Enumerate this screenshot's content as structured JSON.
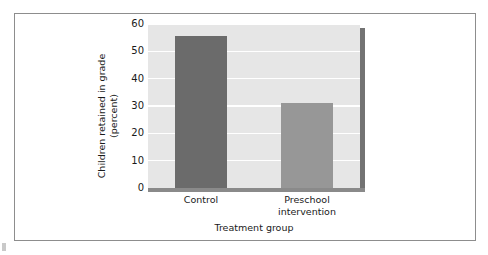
{
  "chart_data": {
    "type": "bar",
    "title": "",
    "subtitle": "",
    "categories": [
      "Control",
      "Preschool intervention"
    ],
    "values": [
      55.5,
      31
    ],
    "series": [
      {
        "name": "Children retained in grade",
        "values": [
          55.5,
          31
        ]
      }
    ],
    "xlabel": "Treatment group",
    "ylabel_line1": "Children retained in grade",
    "ylabel_line2": "(percent)",
    "ylabel": "Children retained in grade (percent)",
    "ylim": [
      0,
      60
    ],
    "ytick_labels": [
      "0",
      "10",
      "20",
      "30",
      "40",
      "50",
      "60"
    ],
    "ytick_values": [
      0,
      10,
      20,
      30,
      40,
      50,
      60
    ],
    "xtick_labels": [
      [
        "Control"
      ],
      [
        "Preschool",
        "intervention"
      ]
    ],
    "grid": "horizontal-white",
    "legend": "none",
    "bar_colors": [
      "#6b6b6b",
      "#979797"
    ],
    "plot_background": "#e6e6e6",
    "gridline_color": "#ffffff",
    "axis_color": "#8a8a8a",
    "panel_shadow_color": "#737373",
    "frame_color": "#8d8d8d",
    "text_color": "#1a1a1a"
  }
}
